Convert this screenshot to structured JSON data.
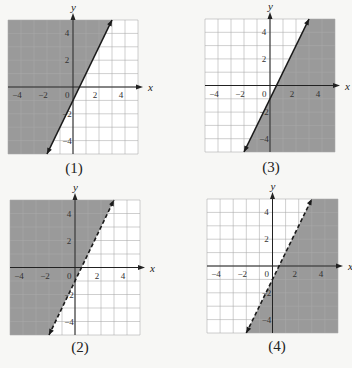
{
  "colors": {
    "shade": "#9a9a9a",
    "grid_on_shade": "#7d7d7d",
    "grid_on_white": "#bdbdbd",
    "line": "#1a1a1a",
    "axis": "#222222"
  },
  "axes": {
    "x_label": "x",
    "y_label": "y",
    "x_ticks": [
      "-4",
      "-2",
      "0",
      "2",
      "4"
    ],
    "y_ticks": [
      "4",
      "2",
      "-2",
      "-4"
    ]
  },
  "panels": [
    {
      "id": "1",
      "caption": "(1)",
      "line_style": "solid",
      "shaded": "left"
    },
    {
      "id": "2",
      "caption": "(2)",
      "line_style": "dashed",
      "shaded": "left"
    },
    {
      "id": "3",
      "caption": "(3)",
      "line_style": "solid",
      "shaded": "right"
    },
    {
      "id": "4",
      "caption": "(4)",
      "line_style": "dashed",
      "shaded": "right"
    }
  ],
  "chart_data": {
    "type": "line",
    "xlabel": "x",
    "ylabel": "y",
    "xlim": [
      -5,
      5
    ],
    "ylim": [
      -5,
      5
    ],
    "grid": true,
    "boundary_line": {
      "slope": 2,
      "intercept": -1,
      "points": [
        [
          -2,
          -5
        ],
        [
          3,
          5
        ]
      ]
    },
    "series": [
      {
        "name": "(1)",
        "line": "solid",
        "shaded_region": "above/left (y >= 2x - 1)"
      },
      {
        "name": "(2)",
        "line": "dashed",
        "shaded_region": "above/left (y > 2x - 1)"
      },
      {
        "name": "(3)",
        "line": "solid",
        "shaded_region": "below/right (y <= 2x - 1)"
      },
      {
        "name": "(4)",
        "line": "dashed",
        "shaded_region": "below/right (y < 2x - 1)"
      }
    ]
  }
}
